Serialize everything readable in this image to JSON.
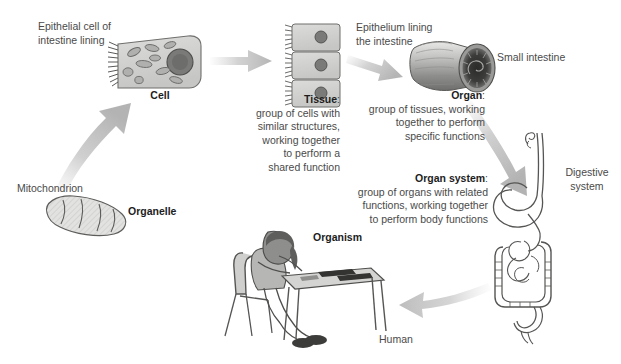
{
  "diagram": {
    "background": "#ffffff",
    "arrow_color": "#b8b8b8",
    "text_color": "#4a4a4a",
    "heading_color": "#1d1d1d"
  },
  "labels": {
    "epithelial_cell": "Epithelial cell of\nintestine lining",
    "cell": "Cell",
    "epithelium_lining": "Epithelium lining\nthe intestine",
    "small_intestine": "Small intestine",
    "mitochondrion": "Mitochondrion",
    "organelle": "Organelle",
    "digestive_system": "Digestive\nsystem",
    "organism": "Organism",
    "human": "Human"
  },
  "descriptions": {
    "tissue": {
      "heading": "Tissue",
      "colon": ":",
      "body": "group of cells with\nsimilar structures,\nworking together\nto perform a\nshared function"
    },
    "organ": {
      "heading": "Organ",
      "colon": ":",
      "body": "group of tissues, working\ntogether to perform\nspecific functions"
    },
    "organ_system": {
      "heading": "Organ system",
      "colon": ":",
      "body": "group of organs with related\nfunctions, working together\nto perform body functions"
    }
  }
}
